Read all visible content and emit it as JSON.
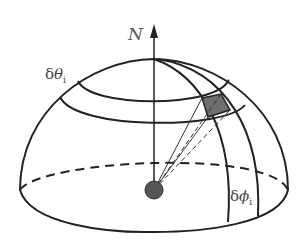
{
  "diagram": {
    "labels": {
      "normal": "N",
      "delta_theta": {
        "delta": "δ",
        "symbol": "θ",
        "subscript": "i"
      },
      "delta_phi": {
        "delta": "δ",
        "symbol": "ϕ",
        "subscript": "i"
      }
    },
    "colors": {
      "stroke": "#222222",
      "patch_fill": "#6e6e6e",
      "source_fill": "#555555",
      "background": "#ffffff"
    }
  }
}
